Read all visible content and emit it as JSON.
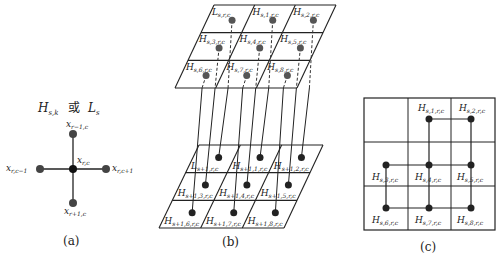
{
  "panel_a": {
    "title_left": "H",
    "title_left_sub": "s,k",
    "title_or": "或",
    "title_right": "L",
    "title_right_sub": "s",
    "nodes": {
      "top": {
        "base": "x",
        "sub": "r−1,c"
      },
      "center": {
        "base": "x",
        "sub": "r,c"
      },
      "left": {
        "base": "x",
        "sub": "r,c−1"
      },
      "right": {
        "base": "x",
        "sub": "r,c+1"
      },
      "bottom": {
        "base": "x",
        "sub": "r+1,c"
      }
    },
    "caption": "(a)"
  },
  "panel_b": {
    "top_layer": [
      {
        "base": "L",
        "sub": "s,r,c"
      },
      {
        "base": "H",
        "sub": "s,1,r,c"
      },
      {
        "base": "H",
        "sub": "s,2,r,c"
      },
      {
        "base": "H",
        "sub": "s,3,r,c"
      },
      {
        "base": "H",
        "sub": "s,4,r,c"
      },
      {
        "base": "H",
        "sub": "s,5,r,c"
      },
      {
        "base": "H",
        "sub": "s,6,r,c"
      },
      {
        "base": "H",
        "sub": "s,7,r,c"
      },
      {
        "base": "H",
        "sub": "s,8,r,c"
      }
    ],
    "bottom_layer": [
      {
        "base": "L",
        "sub": "s+1,r,c"
      },
      {
        "base": "H",
        "sub": "s+1,1,r,c"
      },
      {
        "base": "H",
        "sub": "s+1,2,r,c"
      },
      {
        "base": "H",
        "sub": "s+1,3,r,c"
      },
      {
        "base": "H",
        "sub": "s+1,4,r,c"
      },
      {
        "base": "H",
        "sub": "s+1,5,r,c"
      },
      {
        "base": "H",
        "sub": "s+1,6,r,c"
      },
      {
        "base": "H",
        "sub": "s+1,7,r,c"
      },
      {
        "base": "H",
        "sub": "s+1,8,r,c"
      }
    ],
    "caption": "(b)"
  },
  "panel_c": {
    "cells": [
      {
        "base": "",
        "sub": ""
      },
      {
        "base": "H",
        "sub": "s,1,r,c"
      },
      {
        "base": "H",
        "sub": "s,2,r,c"
      },
      {
        "base": "H",
        "sub": "s,3,r,c"
      },
      {
        "base": "H",
        "sub": "s,4,r,c"
      },
      {
        "base": "H",
        "sub": "s,5,r,c"
      },
      {
        "base": "H",
        "sub": "s,6,r,c"
      },
      {
        "base": "H",
        "sub": "s,7,r,c"
      },
      {
        "base": "H",
        "sub": "s,8,r,c"
      }
    ],
    "caption": "(c)"
  }
}
